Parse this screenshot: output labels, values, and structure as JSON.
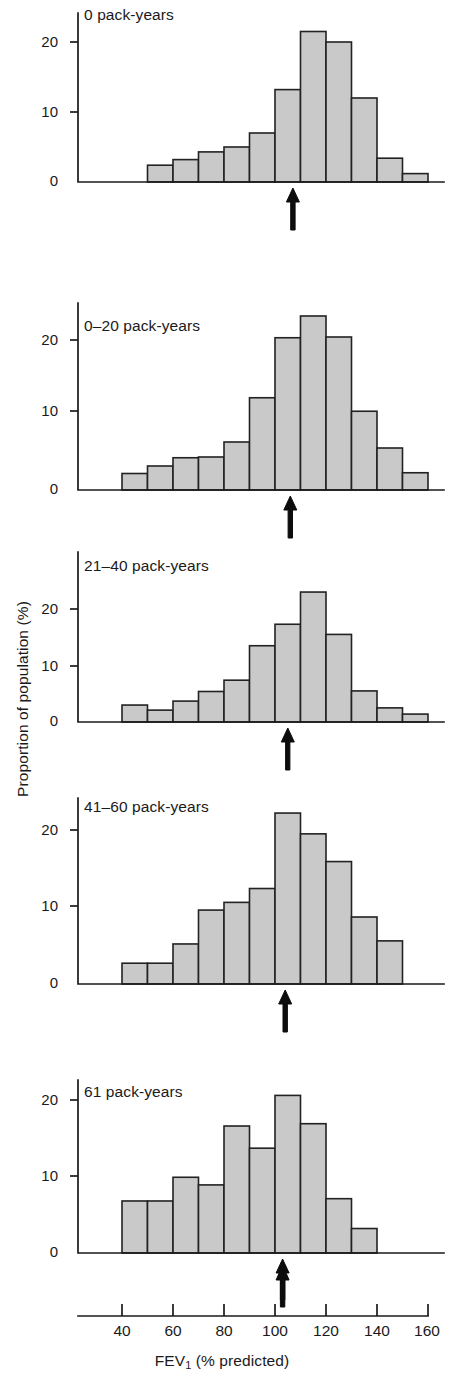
{
  "figure": {
    "xlabel_main": "FEV",
    "xlabel_sub": "1",
    "xlabel_rest": " (% predicted)",
    "ylabel": "Proportion of population (%)",
    "bar_fill_color": "#c9c9c9",
    "bar_edge_color": "#222222",
    "axis_color": "#1a1a1a"
  },
  "chart_data": {
    "type": "bar",
    "title": "",
    "xlabel": "FEV1 (% predicted)",
    "ylabel": "Proportion of population (%)",
    "xlim": [
      30,
      160
    ],
    "ylim": [
      0,
      26
    ],
    "grid": false,
    "legend": "none",
    "xticks": [
      40,
      60,
      80,
      100,
      120,
      140,
      160
    ],
    "xtick_labels": [
      "40",
      "60",
      "80",
      "100",
      "120",
      "140",
      "160"
    ],
    "yticks": [
      0,
      10,
      20
    ],
    "ytick_labels": [
      "0",
      "10",
      "20"
    ],
    "bin_width": 10,
    "annotation": "black arrow marks the mean FEV1 (% predicted) of each group",
    "panels": [
      {
        "label": "0 pack-years",
        "bin_starts": [
          50,
          60,
          70,
          80,
          90,
          100,
          110,
          120,
          130,
          140
        ],
        "values": [
          2.4,
          3.2,
          4.3,
          5.0,
          7.0,
          13.2,
          21.5,
          20.0,
          12.0,
          3.4
        ],
        "extra_bin_start": 150,
        "extra_value": 1.2,
        "arrow_x": 107
      },
      {
        "label": "0–20 pack-years",
        "bin_starts": [
          40,
          50,
          60,
          70,
          80,
          90,
          100,
          110,
          120,
          130,
          140,
          150
        ],
        "values": [
          2.2,
          3.2,
          4.3,
          4.4,
          6.4,
          12.3,
          20.3,
          23.2,
          20.4,
          10.5,
          5.6,
          2.3
        ],
        "arrow_x": 106
      },
      {
        "label": "21–40 pack-years",
        "bin_starts": [
          40,
          50,
          60,
          70,
          80,
          90,
          100,
          110,
          120,
          130,
          140,
          150
        ],
        "values": [
          3.0,
          2.1,
          3.7,
          5.4,
          7.4,
          13.5,
          17.3,
          23.0,
          15.5,
          5.5,
          2.5,
          1.4
        ],
        "arrow_x": 105
      },
      {
        "label": "41–60 pack-years",
        "bin_starts": [
          40,
          50,
          60,
          70,
          80,
          90,
          100,
          110,
          120,
          130,
          140
        ],
        "values": [
          2.7,
          2.7,
          5.2,
          9.6,
          10.6,
          12.4,
          22.2,
          19.5,
          15.9,
          8.7,
          5.6
        ],
        "arrow_x": 104
      },
      {
        "label": "61 pack-years",
        "bin_starts": [
          40,
          50,
          60,
          70,
          80,
          90,
          100,
          110,
          120,
          130
        ],
        "values": [
          6.8,
          6.8,
          9.9,
          8.9,
          16.6,
          13.7,
          20.6,
          16.9,
          7.1,
          3.2
        ],
        "arrow_x": 103
      }
    ]
  }
}
